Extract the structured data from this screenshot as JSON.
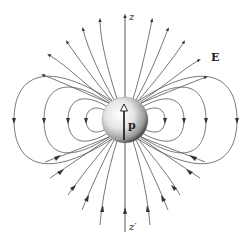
{
  "figure": {
    "labels": {
      "z_axis_top": "z",
      "z_axis_bottom": "z′",
      "field": "E",
      "dipole_moment": "p"
    },
    "colors": {
      "line": "#4a4a4a",
      "sphere_light": "#ffffff",
      "sphere_mid": "#d9d9d9",
      "sphere_dark": "#2a2a2a",
      "background": "#ffffff"
    },
    "sphere": {
      "cx": 125,
      "cy": 120,
      "r": 23
    },
    "closed_loops_left_x": [
      14,
      44,
      68,
      86
    ],
    "closed_loops_right_x": [
      165,
      184,
      206,
      237
    ],
    "open_lines_per_side": 6
  }
}
